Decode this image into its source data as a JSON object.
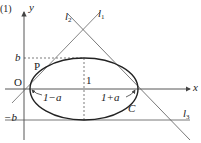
{
  "problem_number": "(1)",
  "axes": {
    "x_label": "x",
    "y_label": "y",
    "origin_label": "O"
  },
  "points": {
    "p_label": "P",
    "c_label": "C"
  },
  "ticks": {
    "b_label": "b",
    "neg_b_label": "−b",
    "one_label": "1"
  },
  "annotations": {
    "left_semi": "1−a",
    "right_semi": "1+a"
  },
  "lines": {
    "l1": "l",
    "l1_sub": "1",
    "l2": "l",
    "l2_sub": "2",
    "l3": "l",
    "l3_sub": "3"
  },
  "colors": {
    "curve": "#222222",
    "line": "#555555",
    "axis": "#444444"
  }
}
